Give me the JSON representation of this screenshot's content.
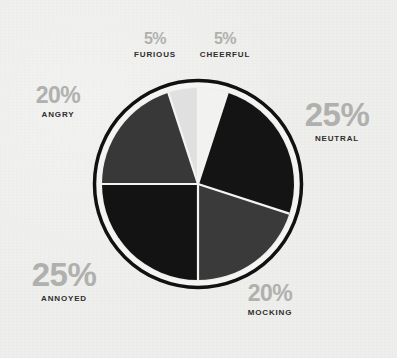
{
  "background_color": "#eeeeec",
  "chart_data": {
    "type": "pie",
    "title": "",
    "subtitle": "",
    "xlabel": "",
    "ylabel": "",
    "legend_position": "around-slices",
    "grid": false,
    "total": 100,
    "units": "percent",
    "categories": [
      "CHEERFUL",
      "NEUTRAL",
      "MOCKING",
      "ANNOYED",
      "ANGRY",
      "FURIOUS"
    ],
    "values": [
      5,
      25,
      20,
      25,
      20,
      5
    ],
    "start_angle_deg": 0,
    "direction": "clockwise",
    "slices": [
      {
        "label": "CHEERFUL",
        "value": 5,
        "display_value": "5%",
        "color": "#f2f2f0",
        "start_angle_deg": 0,
        "end_angle_deg": 18,
        "label_size": "sm"
      },
      {
        "label": "NEUTRAL",
        "value": 25,
        "display_value": "25%",
        "color": "#141414",
        "start_angle_deg": 18,
        "end_angle_deg": 108,
        "label_size": "lg"
      },
      {
        "label": "MOCKING",
        "value": 20,
        "display_value": "20%",
        "color": "#3a3a3a",
        "start_angle_deg": 108,
        "end_angle_deg": 180,
        "label_size": "md"
      },
      {
        "label": "ANNOYED",
        "value": 25,
        "display_value": "25%",
        "color": "#131313",
        "start_angle_deg": 180,
        "end_angle_deg": 270,
        "label_size": "lg"
      },
      {
        "label": "ANGRY",
        "value": 20,
        "display_value": "20%",
        "color": "#383838",
        "start_angle_deg": 270,
        "end_angle_deg": 342,
        "label_size": "md"
      },
      {
        "label": "FURIOUS",
        "value": 5,
        "display_value": "5%",
        "color": "#e0e0e0",
        "start_angle_deg": 342,
        "end_angle_deg": 360,
        "label_size": "sm"
      }
    ],
    "style": {
      "separator_color": "#f4f4f2",
      "ring_color": "#111111",
      "ring_gap_color": "#f4f4f2",
      "value_text_color": "#b0b0ae",
      "name_text_color": "#2e2e2e"
    },
    "geometry": {
      "center_x": 198,
      "center_y": 184,
      "radius": 96
    }
  },
  "labels": {
    "furious": {
      "value": "5%",
      "name": "FURIOUS"
    },
    "cheerful": {
      "value": "5%",
      "name": "CHEERFUL"
    },
    "angry": {
      "value": "20%",
      "name": "ANGRY"
    },
    "neutral": {
      "value": "25%",
      "name": "NEUTRAL"
    },
    "annoyed": {
      "value": "25%",
      "name": "ANNOYED"
    },
    "mocking": {
      "value": "20%",
      "name": "MOCKING"
    }
  }
}
